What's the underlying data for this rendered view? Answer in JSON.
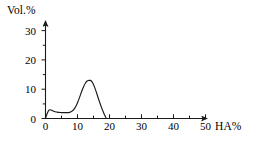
{
  "chart_data": {
    "type": "line",
    "title": "",
    "subtitle": "",
    "xlabel": "HA%",
    "ylabel": "Vol.%",
    "xlim": [
      0,
      53
    ],
    "ylim": [
      0,
      33
    ],
    "grid": false,
    "legend": null,
    "axis_style": "arrowed-l-shape",
    "line_color": "#1a1a1a",
    "background_color": "#ffffff",
    "x_major_ticks": [
      0,
      10,
      20,
      30,
      40,
      50
    ],
    "x_minor_ticks": [
      5,
      15,
      25,
      35,
      45
    ],
    "x_tick_labels": [
      "0",
      "10",
      "20",
      "30",
      "40",
      "50"
    ],
    "y_major_ticks": [
      0,
      10,
      20,
      30
    ],
    "y_minor_ticks": [
      5,
      15,
      25
    ],
    "y_tick_labels": [
      "0",
      "10",
      "20",
      "30"
    ],
    "series": [
      {
        "name": "particle-size-distribution",
        "x": [
          0,
          1,
          2,
          3,
          4,
          5,
          6,
          7,
          8,
          9,
          10,
          11,
          12,
          13,
          14,
          15,
          16,
          17,
          18,
          19,
          20,
          21,
          22,
          23,
          24,
          25,
          26,
          27,
          28,
          29,
          30,
          31,
          32,
          33,
          34,
          35,
          36,
          37,
          38
        ],
        "y": [
          0,
          1.6,
          2.8,
          3.0,
          2.8,
          2.5,
          2.3,
          2.2,
          2.1,
          2.05,
          2.0,
          2.0,
          2.0,
          2.0,
          2.0,
          2.1,
          2.3,
          2.7,
          3.3,
          4.2,
          5.4,
          6.8,
          8.3,
          9.8,
          11.1,
          12.1,
          12.8,
          13.0,
          13.0,
          12.6,
          11.6,
          10.2,
          8.6,
          6.9,
          5.3,
          3.8,
          2.4,
          1.1,
          0
        ]
      }
    ],
    "annotations": {
      "shoulder_peak": {
        "x": 3,
        "y": 3.0
      },
      "plateau": {
        "x_range": [
          8,
          15
        ],
        "y": 2.0
      },
      "main_peak": {
        "x": 28,
        "y": 13.0
      },
      "curve_end": {
        "x": 38,
        "y": 0
      }
    }
  },
  "labels": {
    "y_axis_title": "Vol.%",
    "x_axis_title": "HA%"
  }
}
